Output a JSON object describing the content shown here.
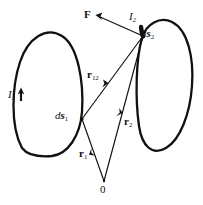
{
  "figure": {
    "background_color": "#ffffff",
    "stroke_color": "#111111"
  },
  "labels": {
    "force": "F",
    "current_1": "I",
    "current_1_sub": "1",
    "current_2": "I",
    "current_2_sub": "2",
    "element_1_d": "d",
    "element_1_s": "s",
    "element_1_sub": "1",
    "element_2_d": "d",
    "element_2_s": "s",
    "element_2_sub": "2",
    "separation_r": "r",
    "separation_sub": "12",
    "position_1_r": "r",
    "position_1_sub": "1",
    "position_2_r": "r",
    "position_2_sub": "2",
    "origin": "0"
  },
  "geometry": {
    "loop_1": {
      "name": "left-current-loop",
      "current_label": "I1",
      "element_label": "ds1",
      "center": [
        50,
        103
      ],
      "rx": 33,
      "ry": 56,
      "rotation_deg": -8
    },
    "loop_2": {
      "name": "right-current-loop",
      "current_label": "I2",
      "element_label": "ds2",
      "center": [
        162,
        88
      ],
      "rx": 29,
      "ry": 55,
      "rotation_deg": 6
    },
    "points": {
      "ds1": [
        82,
        120
      ],
      "ds2": [
        143,
        36
      ],
      "origin": [
        104,
        182
      ],
      "force_tip": [
        97,
        16
      ]
    },
    "vectors": [
      {
        "name": "force-vector",
        "label": "F",
        "from": [
          143,
          36
        ],
        "to": [
          97,
          16
        ],
        "arrow_at": "to"
      },
      {
        "name": "separation-vector",
        "label": "r12",
        "from": [
          82,
          120
        ],
        "to": [
          143,
          36
        ],
        "arrow_at": "mid"
      },
      {
        "name": "position-vector-1",
        "label": "r1",
        "from": [
          104,
          182
        ],
        "to": [
          82,
          120
        ],
        "arrow_at": "mid"
      },
      {
        "name": "position-vector-2",
        "label": "r2",
        "from": [
          104,
          182
        ],
        "to": [
          143,
          36
        ],
        "arrow_at": "mid"
      }
    ],
    "current_arrows": [
      {
        "name": "current-arrow-1",
        "at": [
          22,
          94
        ],
        "direction": "up"
      },
      {
        "name": "current-arrow-2",
        "at": [
          141,
          30
        ],
        "direction": "down-right"
      }
    ]
  }
}
